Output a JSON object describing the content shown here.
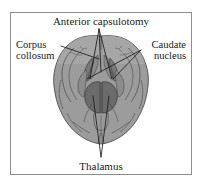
{
  "figure": {
    "title_label": "Anterior capsulotomy",
    "bottom_label": "Thalamus",
    "left_label_line1": "Corpus",
    "left_label_line2": "collosum",
    "right_label_line1": "Caudate",
    "right_label_line2": "nucleus",
    "caption_alt": "Axial brain section with anterior capsulotomy lesion targets",
    "colors": {
      "frame_border": "#8e8e8e",
      "page_background": "#ffffff",
      "brain_tissue": "#9c9c9c",
      "brain_tissue_light": "#b0b0b0",
      "brain_outline": "#4a4a4a",
      "deep_structure": "#6e6e6e",
      "deep_structure_dark": "#616161",
      "leader_line": "#1c1c1c",
      "text": "#1a1a1a"
    },
    "typography": {
      "title_size_px": 11,
      "label_size_px": 10.5
    },
    "leader_lines": {
      "anterior_capsulotomy_apex_x": 99,
      "anterior_capsulotomy_apex_y": 29,
      "thalamus_apex_x": 101,
      "thalamus_apex_y": 157,
      "caudate_origin_x": 141,
      "caudate_origin_y": 50,
      "corpus_origin_x": 61,
      "corpus_origin_y": 46
    }
  }
}
